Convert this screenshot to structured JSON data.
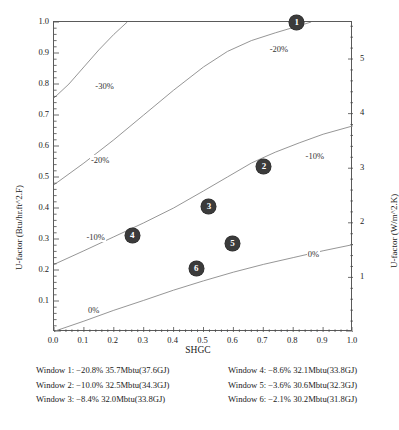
{
  "chart_data": {
    "type": "line",
    "title": "",
    "xlabel": "SHGC",
    "ylabel": "U-factor (Btu/hr.ft^2.F)",
    "ylabel_right": "U-factor (W/m^2.K)",
    "xlim": [
      0.0,
      1.0
    ],
    "ylim": [
      0.0,
      1.0
    ],
    "ylim_right": [
      0.0,
      5.678
    ],
    "grid": false,
    "legend_position": "none",
    "xticks": [
      "0.0",
      "0.1",
      "0.2",
      "0.3",
      "0.4",
      "0.5",
      "0.6",
      "0.7",
      "0.8",
      "0.9",
      "1.0"
    ],
    "yticks_left": [
      "0.1",
      "0.2",
      "0.3",
      "0.4",
      "0.5",
      "0.6",
      "0.7",
      "0.8",
      "0.9",
      "1.0"
    ],
    "yticks_right": [
      "1",
      "2",
      "3",
      "4",
      "5"
    ],
    "contours": [
      {
        "label": "-30%",
        "label_x": 0.135,
        "label_y": 0.795,
        "points": [
          [
            0.0,
            0.755
          ],
          [
            0.05,
            0.8
          ],
          [
            0.1,
            0.855
          ],
          [
            0.15,
            0.91
          ],
          [
            0.2,
            0.96
          ],
          [
            0.245,
            1.0
          ]
        ]
      },
      {
        "label": "-20%",
        "label_x": 0.12,
        "label_y": 0.555,
        "points": [
          [
            0.0,
            0.475
          ],
          [
            0.1,
            0.545
          ],
          [
            0.2,
            0.62
          ],
          [
            0.3,
            0.7
          ],
          [
            0.4,
            0.78
          ],
          [
            0.5,
            0.855
          ],
          [
            0.58,
            0.905
          ],
          [
            0.66,
            0.94
          ],
          [
            0.74,
            0.965
          ],
          [
            0.82,
            0.988
          ],
          [
            0.86,
            1.0
          ]
        ]
      },
      {
        "label": "-20%",
        "label_x": 0.718,
        "label_y": 0.912,
        "points": []
      },
      {
        "label": "-10%",
        "label_x": 0.105,
        "label_y": 0.305,
        "points": [
          [
            0.0,
            0.218
          ],
          [
            0.1,
            0.262
          ],
          [
            0.2,
            0.307
          ],
          [
            0.3,
            0.352
          ],
          [
            0.4,
            0.4
          ],
          [
            0.5,
            0.455
          ],
          [
            0.58,
            0.5
          ],
          [
            0.66,
            0.545
          ],
          [
            0.74,
            0.58
          ],
          [
            0.82,
            0.61
          ],
          [
            0.9,
            0.638
          ],
          [
            1.0,
            0.665
          ]
        ]
      },
      {
        "label": "-10%",
        "label_x": 0.838,
        "label_y": 0.568,
        "points": []
      },
      {
        "label": "0%",
        "label_x": 0.11,
        "label_y": 0.07,
        "points": [
          [
            0.0,
            0.002
          ],
          [
            0.1,
            0.035
          ],
          [
            0.2,
            0.07
          ],
          [
            0.3,
            0.102
          ],
          [
            0.4,
            0.135
          ],
          [
            0.5,
            0.165
          ],
          [
            0.6,
            0.193
          ],
          [
            0.7,
            0.218
          ],
          [
            0.8,
            0.24
          ],
          [
            0.9,
            0.262
          ],
          [
            1.0,
            0.282
          ]
        ]
      },
      {
        "label": "0%",
        "label_x": 0.845,
        "label_y": 0.253,
        "points": []
      }
    ],
    "markers": [
      {
        "label": "1",
        "shgc": 0.812,
        "u_factor": 1.0
      },
      {
        "label": "2",
        "shgc": 0.702,
        "u_factor": 0.533
      },
      {
        "label": "3",
        "shgc": 0.518,
        "u_factor": 0.405
      },
      {
        "label": "4",
        "shgc": 0.262,
        "u_factor": 0.312
      },
      {
        "label": "5",
        "shgc": 0.597,
        "u_factor": 0.285
      },
      {
        "label": "6",
        "shgc": 0.476,
        "u_factor": 0.205
      }
    ],
    "series_color": "#8a8a8a",
    "marker_color": "#3b3b3b"
  },
  "caption": {
    "rows": [
      {
        "left": "Window 1: −20.8% 35.7Mbtu(37.6GJ)",
        "right": "Window 4: −8.6% 32.1Mbtu(33.8GJ)"
      },
      {
        "left": "Window 2: −10.0% 32.5Mbtu(34.3GJ)",
        "right": "Window 5: −3.6% 30.6Mbtu(32.3GJ)"
      },
      {
        "left": "Window 3: −8.4% 32.0Mbtu(33.8GJ)",
        "right": "Window 6: −2.1% 30.2Mbtu(31.8GJ)"
      }
    ]
  }
}
